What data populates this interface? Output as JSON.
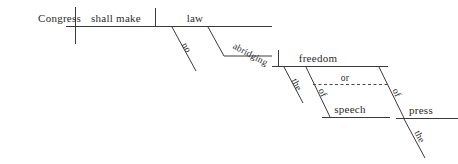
{
  "diagram": {
    "type": "reed-kellogg-sentence-diagram",
    "sentence": "Congress shall make no law abridging the freedom of speech or of the press",
    "background_color": "#ffffff",
    "line_color": "#3a3a3a",
    "text_color": "#2b2b2b",
    "words": {
      "subject": "Congress",
      "verb": "shall make",
      "direct_object": "law",
      "object_modifier": "no",
      "participle": "abridging",
      "participle_object": "freedom",
      "freedom_article": "the",
      "prep_first": "of",
      "prep_first_object": "speech",
      "conjunction": "or",
      "prep_second": "of",
      "prep_second_object": "press",
      "press_article": "the"
    }
  }
}
